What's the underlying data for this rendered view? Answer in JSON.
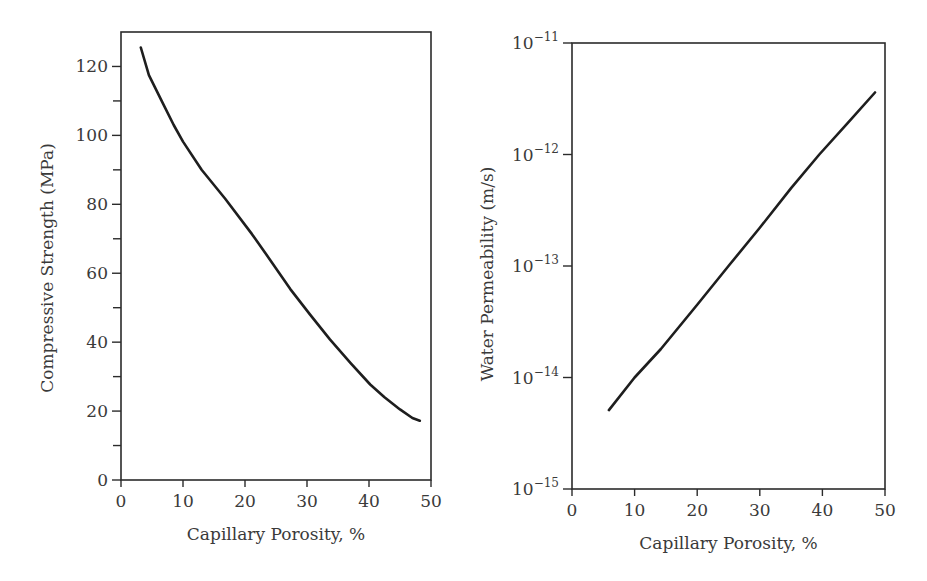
{
  "chart_data": [
    {
      "type": "line",
      "title": "",
      "xlabel": "Capillary Porosity, %",
      "ylabel": "Compressive Strength (MPa)",
      "xlim": [
        0,
        50
      ],
      "ylim": [
        0,
        130
      ],
      "yscale": "linear",
      "grid": false,
      "legend": null,
      "x_ticks": [
        0,
        10,
        20,
        30,
        40,
        50
      ],
      "x_tick_labels": [
        "0",
        "10",
        "20",
        "30",
        "40",
        "50"
      ],
      "y_ticks": [
        0,
        20,
        40,
        60,
        80,
        100,
        120
      ],
      "y_tick_labels": [
        "0",
        "20",
        "40",
        "60",
        "80",
        "100",
        "120"
      ],
      "y_minor_ticks": [
        10,
        30,
        50,
        70,
        90,
        110
      ],
      "series": [
        {
          "name": "Compressive strength vs capillary porosity",
          "x": [
            3.2,
            4.5,
            6.6,
            8.5,
            10.0,
            13.0,
            16.8,
            21.1,
            24.0,
            27.3,
            30.5,
            33.7,
            37.0,
            40.2,
            42.5,
            45.0,
            47.0,
            48.2
          ],
          "y": [
            125.5,
            117.5,
            109.9,
            103.0,
            98.2,
            90.0,
            81.6,
            71.4,
            64.0,
            55.4,
            48.0,
            40.8,
            34.0,
            27.7,
            24.0,
            20.5,
            18.0,
            17.2
          ]
        }
      ]
    },
    {
      "type": "line",
      "title": "",
      "xlabel": "Capillary Porosity, %",
      "ylabel": "Water Permeability (m/s)",
      "xlim": [
        0,
        50
      ],
      "ylim": [
        1e-15,
        1e-11
      ],
      "yscale": "log",
      "grid": false,
      "legend": null,
      "x_ticks": [
        0,
        10,
        20,
        30,
        40,
        50
      ],
      "x_tick_labels": [
        "0",
        "10",
        "20",
        "30",
        "40",
        "50"
      ],
      "y_ticks": [
        1e-15,
        1e-14,
        1e-13,
        1e-12,
        1e-11
      ],
      "y_tick_labels": [
        {
          "base": "10",
          "exp": "−15"
        },
        {
          "base": "10",
          "exp": "−14"
        },
        {
          "base": "10",
          "exp": "−13"
        },
        {
          "base": "10",
          "exp": "−12"
        },
        {
          "base": "10",
          "exp": "−11"
        }
      ],
      "series": [
        {
          "name": "Water permeability vs capillary porosity",
          "x": [
            5.9,
            10.0,
            14.2,
            20.0,
            25.0,
            30.0,
            35.0,
            39.5,
            44.0,
            48.4
          ],
          "y": [
            5.1e-15,
            1e-14,
            1.8e-14,
            4.5e-14,
            1e-13,
            2.2e-13,
            5e-13,
            1e-12,
            1.9e-12,
            3.6e-12
          ]
        }
      ]
    }
  ],
  "panels": [
    {
      "frame": {
        "left": 121,
        "top": 32,
        "right": 431,
        "bottom": 480
      },
      "y_axis_title": "Compressive Strength (MPa)",
      "x_axis_title": "Capillary Porosity, %"
    },
    {
      "frame": {
        "left": 572,
        "top": 43,
        "right": 885,
        "bottom": 489
      },
      "y_axis_title": "Water Permeability (m/s)",
      "x_axis_title": "Capillary Porosity, %"
    }
  ],
  "colors": {
    "line": "#1e1e1e",
    "axis": "#2b2b2b",
    "text": "#3a3a3a",
    "background": "#ffffff"
  }
}
